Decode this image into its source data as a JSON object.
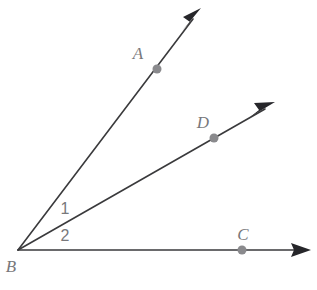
{
  "figure": {
    "kind": "geometry-diagram",
    "background_color": "#ffffff",
    "line_color": "#3a3a3c",
    "arrow_color": "#26262a",
    "dot_color": "#8a8a8d",
    "label_color": "#78787b",
    "vertex": {
      "name": "B",
      "label": "B",
      "x": 18,
      "y": 250
    },
    "rays": [
      {
        "name": "ray-ba",
        "from": "B",
        "through_point": "A",
        "start_x": 18,
        "start_y": 250,
        "end_x": 199,
        "end_y": 11,
        "arrow": true
      },
      {
        "name": "ray-bd",
        "from": "B",
        "through_point": "D",
        "start_x": 18,
        "start_y": 250,
        "end_x": 273,
        "end_y": 103,
        "arrow": true
      },
      {
        "name": "ray-bc",
        "from": "B",
        "through_point": "C",
        "start_x": 18,
        "start_y": 250,
        "end_x": 309,
        "end_y": 250,
        "arrow": true
      }
    ],
    "points": [
      {
        "name": "A",
        "label": "A",
        "dot_x": 157,
        "dot_y": 69,
        "label_x": 138,
        "label_y": 59,
        "radius": 4.5
      },
      {
        "name": "D",
        "label": "D",
        "dot_x": 214,
        "dot_y": 138,
        "label_x": 198,
        "label_y": 128,
        "radius": 4.5
      },
      {
        "name": "C",
        "label": "C",
        "dot_x": 242,
        "dot_y": 250,
        "label_x": 236,
        "label_y": 240,
        "radius": 4.5
      },
      {
        "name": "B",
        "label": "B",
        "dot_x": null,
        "dot_y": null,
        "label_x": 5,
        "label_y": 272,
        "radius": 0
      }
    ],
    "angle_labels": [
      {
        "name": "angle-1",
        "label": "1",
        "x": 60,
        "y": 214,
        "between": "ray-ba and ray-bd"
      },
      {
        "name": "angle-2",
        "label": "2",
        "x": 60,
        "y": 240,
        "between": "ray-bd and ray-bc"
      }
    ]
  }
}
